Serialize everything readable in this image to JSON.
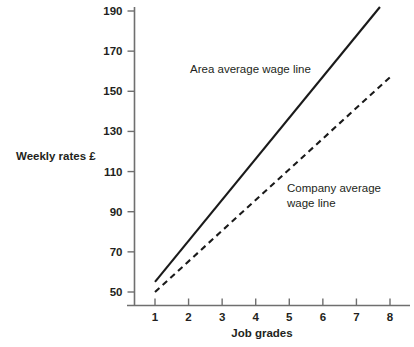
{
  "chart_data": {
    "type": "line",
    "title": "",
    "subtitle": "",
    "xlabel": "Job grades",
    "ylabel": "Weekly rates £",
    "xlim": [
      0.55,
      8.45
    ],
    "ylim": [
      43,
      196
    ],
    "grid": false,
    "legend_position": "inline-annotation",
    "x_ticks": [
      "1",
      "2",
      "3",
      "4",
      "5",
      "6",
      "7",
      "8"
    ],
    "x_tick_values": [
      1,
      2,
      3,
      4,
      5,
      6,
      7,
      8
    ],
    "y_ticks": [
      "50",
      "70",
      "90",
      "110",
      "130",
      "150",
      "170",
      "190"
    ],
    "y_tick_values": [
      50,
      70,
      90,
      110,
      130,
      150,
      170,
      190
    ],
    "series": [
      {
        "name": "Area average wage line",
        "style": "solid",
        "color": "#1a1a1a",
        "x": [
          1,
          7.7
        ],
        "values": [
          55,
          192
        ]
      },
      {
        "name": "Company average wage line",
        "style": "dashed",
        "color": "#1a1a1a",
        "x": [
          1,
          8
        ],
        "values": [
          50,
          157
        ]
      }
    ],
    "annotations": [
      {
        "id": "area-line-annotation",
        "text": "Area average wage line",
        "lines": [
          "Area average wage line"
        ],
        "x": 190,
        "y": 73
      },
      {
        "id": "company-line-annotation",
        "text": "Company average wage line",
        "lines": [
          "Company average",
          "wage line"
        ],
        "x": 287,
        "y": 192
      }
    ]
  },
  "axis": {
    "x_title": "Job grades",
    "y_title": "Weekly rates £"
  },
  "colors": {
    "background": "#ffffff",
    "axis": "#6f6f6f",
    "line": "#1a1a1a",
    "text": "#231f20"
  }
}
